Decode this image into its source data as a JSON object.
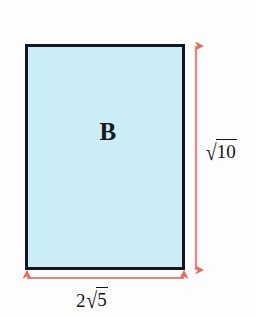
{
  "figure": {
    "type": "geometry-diagram",
    "background_color": "#fdfdfd"
  },
  "shape": {
    "name": "rectangle",
    "label": "B",
    "fill_color": "#cbeef6",
    "stroke_color": "#15171e",
    "stroke_width_px": 3
  },
  "dimensions": {
    "arrow_color": "#ef8278",
    "arrowhead_color": "#e8695c",
    "height": {
      "position": "right",
      "coefficient": "",
      "radicand": "10",
      "radical_symbol": "√",
      "text": "√10"
    },
    "width": {
      "position": "bottom",
      "coefficient": "2",
      "radicand": "5",
      "radical_symbol": "√",
      "text": "2√5"
    }
  }
}
